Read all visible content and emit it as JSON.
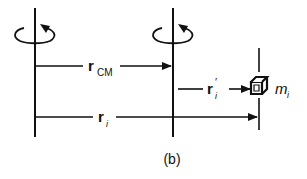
{
  "figure": {
    "caption": "(b)",
    "labels": {
      "r_cm_main": "r",
      "r_cm_sub": "CM",
      "r_i_prime_main": "r",
      "r_i_prime_prime": "′",
      "r_i_prime_sub": "i",
      "r_i_main": "r",
      "r_i_sub": "i",
      "mass_main": "m",
      "mass_sub": "i"
    },
    "elements": [
      "rotation-axis-fixed",
      "rotation-axis-center-of-mass",
      "particle-axis",
      "rotation-arrow",
      "vector-r-cm",
      "vector-r-i-prime",
      "vector-r-i",
      "mass-cube"
    ]
  }
}
